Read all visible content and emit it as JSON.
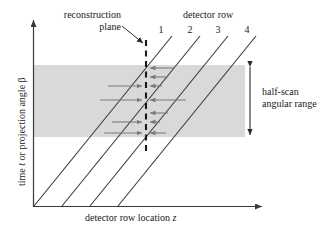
{
  "figure": {
    "type": "technical-diagram",
    "axes": {
      "y_label_text": "time ",
      "y_label_italic": "t",
      "y_label_text2": " or projection angle β",
      "x_label_text": "detector row location ",
      "x_label_italic": "z"
    },
    "annotations": {
      "reconstruction_plane_line1": "reconstruction",
      "reconstruction_plane_line2": "plane",
      "detector_row_title": "detector row",
      "half_scan_line1": "half-scan",
      "half_scan_line2": "angular range"
    },
    "detector_rows": [
      {
        "label": "1"
      },
      {
        "label": "2"
      },
      {
        "label": "3"
      },
      {
        "label": "4"
      }
    ],
    "colors": {
      "band_fill": "#d9d9d9",
      "line": "#3a3a3a",
      "arrow": "#7a7a7a",
      "dashed": "#1a1a1a",
      "text": "#1a1a1a"
    }
  }
}
